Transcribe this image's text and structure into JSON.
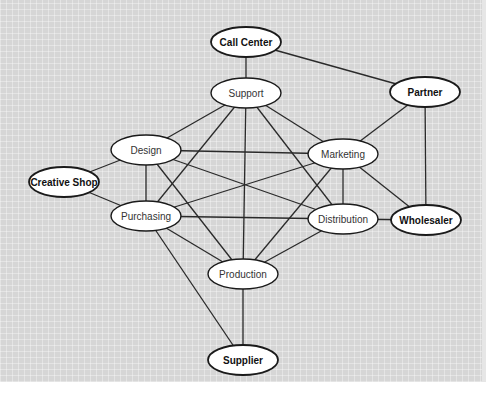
{
  "diagram": {
    "type": "network",
    "colors": {
      "background": "#d6d6d6",
      "node_fill": "#ffffff",
      "stroke": "#1a1a1a"
    },
    "nodes": [
      {
        "id": "call_center",
        "label": "Call Center",
        "x": 246,
        "y": 42,
        "external": true
      },
      {
        "id": "support",
        "label": "Support",
        "x": 246,
        "y": 93,
        "external": false
      },
      {
        "id": "partner",
        "label": "Partner",
        "x": 425,
        "y": 92,
        "external": true
      },
      {
        "id": "design",
        "label": "Design",
        "x": 146,
        "y": 150,
        "external": false
      },
      {
        "id": "marketing",
        "label": "Marketing",
        "x": 343,
        "y": 154,
        "external": false
      },
      {
        "id": "creative_shop",
        "label": "Creative Shop",
        "x": 64,
        "y": 182,
        "external": true
      },
      {
        "id": "purchasing",
        "label": "Purchasing",
        "x": 146,
        "y": 216,
        "external": false
      },
      {
        "id": "distribution",
        "label": "Distribution",
        "x": 343,
        "y": 219,
        "external": false
      },
      {
        "id": "wholesaler",
        "label": "Wholesaler",
        "x": 426,
        "y": 220,
        "external": true
      },
      {
        "id": "production",
        "label": "Production",
        "x": 243,
        "y": 274,
        "external": false
      },
      {
        "id": "supplier",
        "label": "Supplier",
        "x": 243,
        "y": 360,
        "external": true
      }
    ],
    "edges": [
      [
        "call_center",
        "support"
      ],
      [
        "call_center",
        "partner"
      ],
      [
        "support",
        "design"
      ],
      [
        "support",
        "marketing"
      ],
      [
        "support",
        "purchasing"
      ],
      [
        "support",
        "distribution"
      ],
      [
        "support",
        "production"
      ],
      [
        "partner",
        "marketing"
      ],
      [
        "partner",
        "wholesaler"
      ],
      [
        "design",
        "creative_shop"
      ],
      [
        "design",
        "purchasing"
      ],
      [
        "design",
        "marketing"
      ],
      [
        "design",
        "distribution"
      ],
      [
        "design",
        "production"
      ],
      [
        "creative_shop",
        "purchasing"
      ],
      [
        "purchasing",
        "marketing"
      ],
      [
        "purchasing",
        "distribution"
      ],
      [
        "purchasing",
        "production"
      ],
      [
        "purchasing",
        "supplier"
      ],
      [
        "marketing",
        "distribution"
      ],
      [
        "marketing",
        "production"
      ],
      [
        "marketing",
        "wholesaler"
      ],
      [
        "distribution",
        "wholesaler"
      ],
      [
        "distribution",
        "production"
      ],
      [
        "production",
        "supplier"
      ]
    ]
  }
}
